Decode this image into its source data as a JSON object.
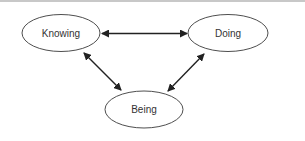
{
  "diagram": {
    "colors": {
      "stroke": "#3a3a3a",
      "arrow": "#222222",
      "text": "#333333",
      "background": "#ffffff",
      "top_rule": "#c8c8c8"
    },
    "nodes": [
      {
        "id": "knowing",
        "label": "Knowing",
        "cx": 61,
        "cy": 33,
        "rx": 39,
        "ry": 18.5
      },
      {
        "id": "doing",
        "label": "Doing",
        "cx": 228,
        "cy": 33,
        "rx": 40,
        "ry": 18.5
      },
      {
        "id": "being",
        "label": "Being",
        "cx": 144,
        "cy": 109.5,
        "rx": 39,
        "ry": 18.5
      }
    ],
    "edges": [
      {
        "from": "knowing",
        "to": "doing",
        "direction": "bidirectional"
      },
      {
        "from": "knowing",
        "to": "being",
        "direction": "bidirectional"
      },
      {
        "from": "doing",
        "to": "being",
        "direction": "bidirectional"
      }
    ]
  }
}
